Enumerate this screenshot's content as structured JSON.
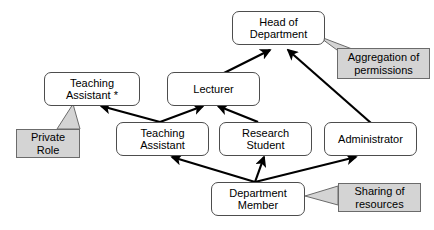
{
  "diagram": {
    "background_color": "#ffffff",
    "node_fill_color": "#ffffff",
    "node_border_color": "#4d4d4d",
    "callout_fill_color": "#d4d4d4",
    "callout_border_color": "#6b6b6b",
    "edge_color": "#000000",
    "nodes": [
      {
        "id": "head-of-department",
        "label": "Head of\nDepartment",
        "x": 232,
        "y": 11,
        "w": 93,
        "h": 34
      },
      {
        "id": "teaching-assistant-private",
        "label": "Teaching\nAssistant *",
        "x": 44,
        "y": 72,
        "w": 96,
        "h": 34
      },
      {
        "id": "lecturer",
        "label": "Lecturer",
        "x": 167,
        "y": 72,
        "w": 93,
        "h": 34
      },
      {
        "id": "teaching-assistant",
        "label": "Teaching\nAssistant",
        "x": 116,
        "y": 122,
        "w": 93,
        "h": 34
      },
      {
        "id": "research-student",
        "label": "Research\nStudent",
        "x": 219,
        "y": 122,
        "w": 93,
        "h": 34
      },
      {
        "id": "administrator",
        "label": "Administrator",
        "x": 324,
        "y": 122,
        "w": 93,
        "h": 34
      },
      {
        "id": "department-member",
        "label": "Department\nMember",
        "x": 211,
        "y": 182,
        "w": 94,
        "h": 34
      }
    ],
    "callouts": [
      {
        "id": "aggregation-of-permissions",
        "label": "Aggregation of\npermissions",
        "x": 337,
        "y": 48,
        "w": 93,
        "h": 31,
        "tail": "337,50 318,36 360,52"
      },
      {
        "id": "private-role",
        "label": "Private\nRole",
        "x": 16,
        "y": 129,
        "w": 64,
        "h": 29,
        "tail": "57,129 73,104 80,129"
      },
      {
        "id": "sharing-of-resources",
        "label": "Sharing of\nresources",
        "x": 338,
        "y": 183,
        "w": 83,
        "h": 29,
        "tail": "338,186 305,196 338,205"
      }
    ],
    "edges": [
      {
        "id": "lecturer-to-head",
        "from": "lecturer",
        "to": "head-of-department",
        "x1": 224,
        "y1": 73,
        "x2": 270,
        "y2": 50
      },
      {
        "id": "administrator-to-head",
        "from": "administrator",
        "to": "head-of-department",
        "x1": 371,
        "y1": 123,
        "x2": 288,
        "y2": 50
      },
      {
        "id": "teaching-assistant-to-private",
        "from": "teaching-assistant",
        "to": "teaching-assistant-private",
        "x1": 160,
        "y1": 122,
        "x2": 101,
        "y2": 106
      },
      {
        "id": "teaching-assistant-to-lecturer",
        "from": "teaching-assistant",
        "to": "lecturer",
        "x1": 160,
        "y1": 122,
        "x2": 203,
        "y2": 106
      },
      {
        "id": "research-student-to-lecturer",
        "from": "research-student",
        "to": "lecturer",
        "x1": 258,
        "y1": 122,
        "x2": 218,
        "y2": 106
      },
      {
        "id": "member-to-teaching-assistant",
        "from": "department-member",
        "to": "teaching-assistant",
        "x1": 255,
        "y1": 182,
        "x2": 172,
        "y2": 157
      },
      {
        "id": "member-to-research-student",
        "from": "department-member",
        "to": "research-student",
        "x1": 255,
        "y1": 182,
        "x2": 264,
        "y2": 157
      },
      {
        "id": "member-to-administrator",
        "from": "department-member",
        "to": "administrator",
        "x1": 255,
        "y1": 182,
        "x2": 356,
        "y2": 157
      }
    ]
  }
}
